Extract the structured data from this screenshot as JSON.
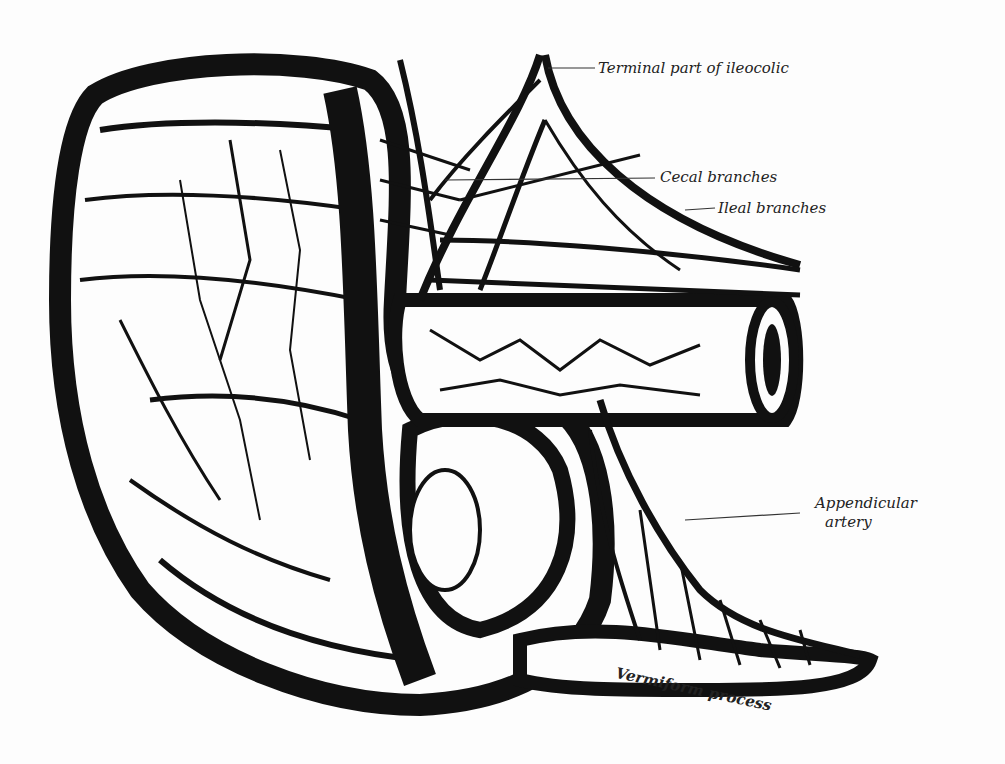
{
  "figure": {
    "labels": [
      {
        "id": "terminal",
        "text": "Terminal part of ileocolic"
      },
      {
        "id": "cecal",
        "text": "Cecal branches"
      },
      {
        "id": "ileal",
        "text": "Ileal branches"
      },
      {
        "id": "appendicular_1",
        "text": "Appendicular"
      },
      {
        "id": "appendicular_2",
        "text": "artery"
      },
      {
        "id": "vermiform",
        "text": "Vermiform process"
      }
    ],
    "colors": {
      "ink": "#111111",
      "paper": "#fdfdfd"
    }
  }
}
